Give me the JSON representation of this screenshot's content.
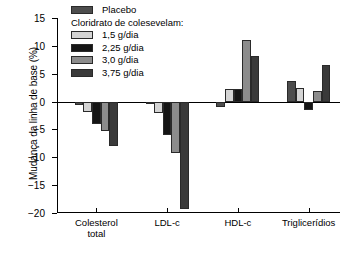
{
  "chart_data": {
    "type": "bar",
    "title": "",
    "subtitle": "",
    "xlabel": "",
    "ylabel": "Mudança da linha de base (%)",
    "categories": [
      "Colesterol\ntotal",
      "LDL-c",
      "HDL-c",
      "Triglicerídios"
    ],
    "category_labels_flat": [
      "Colesterol total",
      "LDL-c",
      "HDL-c",
      "Triglicerídios"
    ],
    "ylim": [
      -20,
      15
    ],
    "yticks": [
      15,
      10,
      5,
      0,
      -5,
      -10,
      -15,
      -20
    ],
    "ytick_labels": [
      "15",
      "10",
      "5",
      "0",
      "−5",
      "−10",
      "−15",
      "−20"
    ],
    "grid": false,
    "legend_position": "top-left",
    "zero_line": true,
    "series": [
      {
        "name": "Placebo",
        "color": "#4d4d4d",
        "values": [
          -0.7,
          -0.4,
          -1.0,
          3.7
        ]
      },
      {
        "name": "1,5 g/dia",
        "color": "#d4d4d4",
        "values": [
          -1.8,
          -2.0,
          2.2,
          2.4
        ]
      },
      {
        "name": "2,25 g/dia",
        "color": "#151515",
        "values": [
          -4.0,
          -6.0,
          2.2,
          -1.6
        ]
      },
      {
        "name": "3,0 g/dia",
        "color": "#8c8c8c",
        "values": [
          -5.2,
          -9.2,
          11.1,
          1.9
        ]
      },
      {
        "name": "3,75 g/dia",
        "color": "#3a3a3a",
        "values": [
          -8.0,
          -19.3,
          8.2,
          6.6
        ]
      }
    ]
  },
  "legend": {
    "placebo_label": "Placebo",
    "group_heading": "Cloridrato de colesevelam:",
    "dose_labels": [
      "1,5 g/dia",
      "2,25 g/dia",
      "3,0 g/dia",
      "3,75 g/dia"
    ]
  },
  "colors": {
    "axis": "#000000",
    "background": "#ffffff",
    "placebo": "#4d4d4d",
    "dose_1_5": "#d4d4d4",
    "dose_2_25": "#151515",
    "dose_3_0": "#8c8c8c",
    "dose_3_75": "#3a3a3a"
  }
}
